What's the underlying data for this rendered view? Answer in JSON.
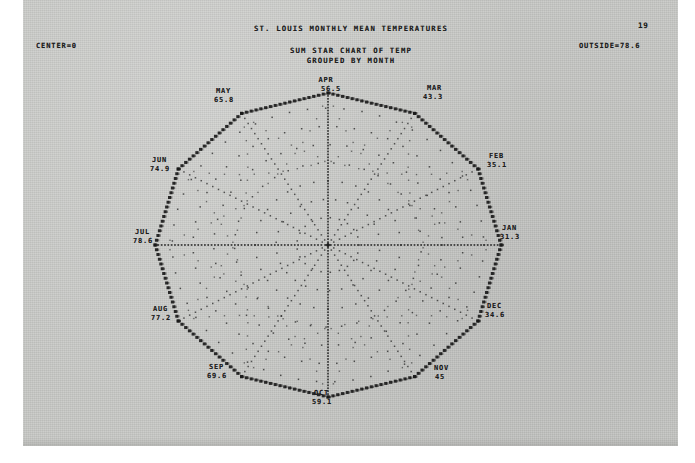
{
  "page": {
    "number": "19",
    "background_color": "#c8c9c6",
    "ink_color": "#1c1c1c"
  },
  "header": {
    "title": "ST. LOUIS MONTHLY MEAN TEMPERATURES",
    "subtitle_1": "SUM STAR CHART OF TEMP",
    "subtitle_2": "GROUPED BY MONTH",
    "center_label": "CENTER=0",
    "outside_label": "OUTSIDE=78.6"
  },
  "chart_data": {
    "type": "line",
    "title": "ST. LOUIS MONTHLY MEAN TEMPERATURES",
    "subtitle": "SUM STAR CHART OF TEMP GROUPED BY MONTH",
    "xlabel": "",
    "ylabel": "",
    "center_value": 0,
    "outside_value": 78.6,
    "rlim": [
      0,
      78.6
    ],
    "grid": true,
    "legend": "none",
    "categories": [
      "JAN",
      "FEB",
      "MAR",
      "APR",
      "MAY",
      "JUN",
      "JUL",
      "AUG",
      "SEP",
      "OCT",
      "NOV",
      "DEC"
    ],
    "values": [
      31.3,
      35.1,
      43.3,
      56.5,
      65.8,
      74.9,
      78.6,
      77.2,
      69.6,
      59.1,
      45,
      34.6
    ],
    "series": [
      {
        "name": "Monthly mean temperature",
        "values": [
          31.3,
          35.1,
          43.3,
          56.5,
          65.8,
          74.9,
          78.6,
          77.2,
          69.6,
          59.1,
          45,
          34.6
        ]
      }
    ],
    "points": [
      {
        "month": "JAN",
        "value": "31.3",
        "label": "JAN",
        "value_text": "31.3",
        "angle_deg": 0
      },
      {
        "month": "FEB",
        "value": "35.1",
        "label": "FEB",
        "value_text": "35.1",
        "angle_deg": 30
      },
      {
        "month": "MAR",
        "value": "43.3",
        "label": "MAR",
        "value_text": "43.3",
        "angle_deg": 60
      },
      {
        "month": "APR",
        "value": "56.5",
        "label": "APR",
        "value_text": "56.5",
        "angle_deg": 90
      },
      {
        "month": "MAY",
        "value": "65.8",
        "label": "MAY",
        "value_text": "65.8",
        "angle_deg": 120
      },
      {
        "month": "JUN",
        "value": "74.9",
        "label": "JUN",
        "value_text": "74.9",
        "angle_deg": 150
      },
      {
        "month": "JUL",
        "value": "78.6",
        "label": "JUL",
        "value_text": "78.6",
        "angle_deg": 180
      },
      {
        "month": "AUG",
        "value": "77.2",
        "label": "AUG",
        "value_text": "77.2",
        "angle_deg": 210
      },
      {
        "month": "SEP",
        "value": "69.6",
        "label": "SEP",
        "value_text": "69.6",
        "angle_deg": 240
      },
      {
        "month": "OCT",
        "value": "59.1",
        "label": "OCT",
        "value_text": "59.1",
        "angle_deg": 270
      },
      {
        "month": "NOV",
        "value": "45",
        "label": "NOV",
        "value_text": "45",
        "angle_deg": 300
      },
      {
        "month": "DEC",
        "value": "34.6",
        "label": "DEC",
        "value_text": "34.6",
        "angle_deg": 330
      }
    ]
  }
}
